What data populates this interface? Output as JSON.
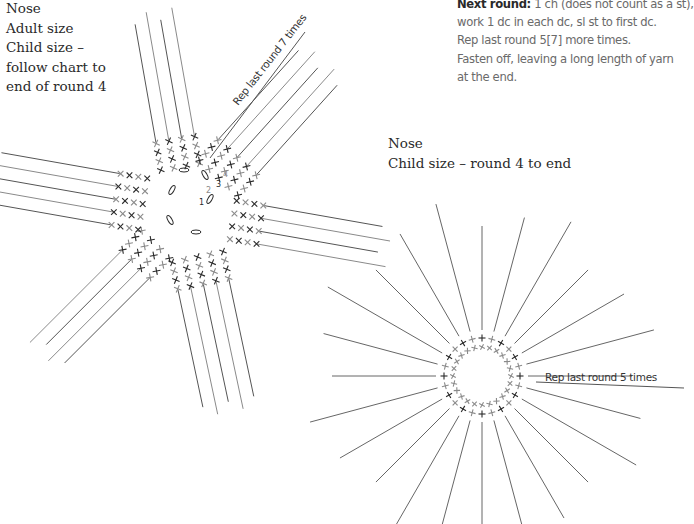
{
  "left_chart": {
    "title": "Nose",
    "lines": [
      "Adult size",
      "Child size –",
      "follow chart to",
      "end of round 4"
    ],
    "annotation": "Rep last round 7 times",
    "round_numbers": [
      "1",
      "2",
      "3",
      "4"
    ]
  },
  "instructions": {
    "next_round_label": "Next round:",
    "next_round_text": "1 ch (does not count as a st),",
    "line2": "work 1 dc in each dc, sl st to first dc.",
    "line3": "Rep last round 5[7] more times.",
    "line4": "Fasten off, leaving a long length of yarn",
    "line5": "at the end."
  },
  "right_chart": {
    "title": "Nose",
    "subtitle": "Child size – round 4 to end",
    "annotation": "Rep last round 5 times"
  },
  "colors": {
    "ink_dark": "#2a2a2a",
    "ink_grey": "#8a8a8a",
    "text_grey": "#6a6a6a"
  }
}
